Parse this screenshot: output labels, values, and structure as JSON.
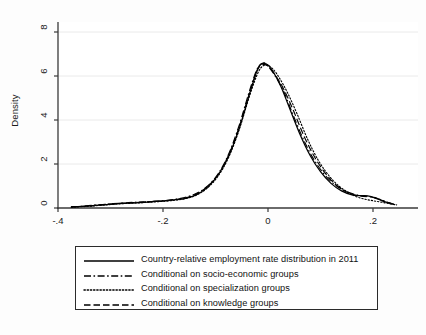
{
  "figure": {
    "background": "#fdfdfd",
    "plot_background": "#ffffff",
    "line_color": "#000000",
    "grid_color": "#e8e8e8",
    "axis_color": "#3a3a3a"
  },
  "axes": {
    "y_title": "Density",
    "y_ticks": [
      "0",
      "2",
      "4",
      "6",
      "8"
    ],
    "x_ticks": [
      "-.4",
      "-.2",
      "0",
      ".2"
    ]
  },
  "legend": {
    "entries": [
      {
        "label": "Country-relative employment rate distribution in 2011",
        "style": "solid"
      },
      {
        "label": "Conditional on socio-economic groups",
        "style": "dash-dot"
      },
      {
        "label": "Conditional on specialization groups",
        "style": "dotted"
      },
      {
        "label": "Conditional on knowledge groups",
        "style": "dashed"
      }
    ]
  },
  "chart_data": {
    "type": "line",
    "title": "",
    "xlabel": "",
    "ylabel": "Density",
    "xlim": [
      -0.42,
      0.28
    ],
    "ylim": [
      0,
      8.6
    ],
    "x_ticks": [
      -0.4,
      -0.2,
      0,
      0.2
    ],
    "y_ticks": [
      0,
      2,
      4,
      6,
      8
    ],
    "grid": "horizontal",
    "legend_position": "below-plot",
    "series": [
      {
        "name": "Country-relative employment rate distribution in 2011",
        "style": "solid",
        "x": [
          -0.375,
          -0.355,
          -0.335,
          -0.315,
          -0.295,
          -0.275,
          -0.255,
          -0.235,
          -0.215,
          -0.195,
          -0.175,
          -0.155,
          -0.135,
          -0.115,
          -0.095,
          -0.075,
          -0.055,
          -0.035,
          -0.02,
          -0.012,
          0.0,
          0.012,
          0.025,
          0.04,
          0.06,
          0.08,
          0.1,
          0.12,
          0.14,
          0.16,
          0.175,
          0.19,
          0.205,
          0.22,
          0.235
        ],
        "y": [
          0.05,
          0.07,
          0.1,
          0.14,
          0.18,
          0.21,
          0.23,
          0.26,
          0.3,
          0.33,
          0.38,
          0.45,
          0.62,
          0.95,
          1.5,
          2.35,
          3.6,
          5.2,
          6.3,
          6.55,
          6.5,
          6.1,
          5.5,
          4.6,
          3.4,
          2.4,
          1.65,
          1.12,
          0.78,
          0.6,
          0.56,
          0.55,
          0.45,
          0.3,
          0.2
        ]
      },
      {
        "name": "Conditional on socio-economic groups",
        "style": "dash-dot",
        "x": [
          -0.375,
          -0.355,
          -0.335,
          -0.315,
          -0.295,
          -0.275,
          -0.255,
          -0.235,
          -0.215,
          -0.195,
          -0.175,
          -0.155,
          -0.135,
          -0.115,
          -0.095,
          -0.075,
          -0.055,
          -0.035,
          -0.02,
          -0.008,
          0.0,
          0.015,
          0.03,
          0.045,
          0.065,
          0.085,
          0.105,
          0.125,
          0.145,
          0.165,
          0.18,
          0.195,
          0.21,
          0.225,
          0.24
        ],
        "y": [
          0.05,
          0.08,
          0.12,
          0.16,
          0.2,
          0.23,
          0.26,
          0.28,
          0.31,
          0.34,
          0.4,
          0.5,
          0.68,
          1.0,
          1.55,
          2.45,
          3.75,
          5.35,
          6.35,
          6.6,
          6.45,
          5.95,
          5.3,
          4.4,
          3.25,
          2.3,
          1.6,
          1.1,
          0.8,
          0.62,
          0.55,
          0.52,
          0.42,
          0.28,
          0.17
        ]
      },
      {
        "name": "Conditional on specialization groups",
        "style": "dotted",
        "x": [
          -0.375,
          -0.355,
          -0.335,
          -0.315,
          -0.295,
          -0.275,
          -0.255,
          -0.235,
          -0.215,
          -0.195,
          -0.175,
          -0.155,
          -0.135,
          -0.115,
          -0.095,
          -0.075,
          -0.055,
          -0.035,
          -0.018,
          -0.005,
          0.008,
          0.022,
          0.038,
          0.055,
          0.075,
          0.095,
          0.115,
          0.135,
          0.155,
          0.17,
          0.185,
          0.2,
          0.215,
          0.23,
          0.245
        ],
        "y": [
          0.04,
          0.06,
          0.09,
          0.13,
          0.17,
          0.2,
          0.22,
          0.25,
          0.28,
          0.31,
          0.36,
          0.44,
          0.6,
          0.92,
          1.45,
          2.3,
          3.55,
          5.1,
          6.2,
          6.5,
          6.35,
          5.9,
          5.2,
          4.3,
          3.15,
          2.2,
          1.5,
          1.0,
          0.68,
          0.5,
          0.4,
          0.33,
          0.27,
          0.2,
          0.14
        ]
      },
      {
        "name": "Conditional on knowledge groups",
        "style": "dashed",
        "x": [
          -0.375,
          -0.355,
          -0.335,
          -0.315,
          -0.295,
          -0.275,
          -0.255,
          -0.235,
          -0.215,
          -0.195,
          -0.175,
          -0.155,
          -0.135,
          -0.115,
          -0.095,
          -0.075,
          -0.055,
          -0.035,
          -0.02,
          -0.01,
          0.002,
          0.015,
          0.03,
          0.048,
          0.068,
          0.088,
          0.108,
          0.128,
          0.148,
          0.168,
          0.182,
          0.197,
          0.212,
          0.227,
          0.24
        ],
        "y": [
          0.05,
          0.07,
          0.11,
          0.15,
          0.19,
          0.22,
          0.25,
          0.27,
          0.3,
          0.33,
          0.39,
          0.47,
          0.65,
          0.98,
          1.52,
          2.4,
          3.68,
          5.25,
          6.28,
          6.52,
          6.42,
          6.0,
          5.4,
          4.45,
          3.3,
          2.35,
          1.62,
          1.08,
          0.75,
          0.58,
          0.53,
          0.5,
          0.4,
          0.26,
          0.16
        ]
      }
    ]
  }
}
